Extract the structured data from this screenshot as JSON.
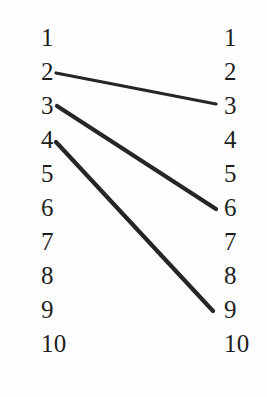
{
  "diagram": {
    "type": "bipartite-mapping",
    "background_color": "#fefefe",
    "text_color": "#1e1e1e",
    "edge_color": "#262626",
    "left_column": {
      "name": "left-column",
      "x": 41,
      "nodes": [
        {
          "label": "1",
          "y": 43
        },
        {
          "label": "2",
          "y": 77
        },
        {
          "label": "3",
          "y": 111
        },
        {
          "label": "4",
          "y": 145
        },
        {
          "label": "5",
          "y": 179
        },
        {
          "label": "6",
          "y": 213
        },
        {
          "label": "7",
          "y": 247
        },
        {
          "label": "8",
          "y": 281
        },
        {
          "label": "9",
          "y": 315
        },
        {
          "label": "10",
          "y": 349
        }
      ]
    },
    "right_column": {
      "name": "right-column",
      "x": 224,
      "nodes": [
        {
          "label": "1",
          "y": 43
        },
        {
          "label": "2",
          "y": 77
        },
        {
          "label": "3",
          "y": 111
        },
        {
          "label": "4",
          "y": 145
        },
        {
          "label": "5",
          "y": 179
        },
        {
          "label": "6",
          "y": 213
        },
        {
          "label": "7",
          "y": 247
        },
        {
          "label": "8",
          "y": 281
        },
        {
          "label": "9",
          "y": 315
        },
        {
          "label": "10",
          "y": 349
        }
      ]
    },
    "edges": [
      {
        "from": "2",
        "to": "3",
        "x1": 56,
        "y1": 73,
        "x2": 216,
        "y2": 104,
        "width": 3.2
      },
      {
        "from": "3",
        "to": "6",
        "x1": 57,
        "y1": 106,
        "x2": 216,
        "y2": 209,
        "width": 4.2
      },
      {
        "from": "4",
        "to": "9",
        "x1": 56,
        "y1": 142,
        "x2": 213,
        "y2": 311,
        "width": 4.2
      }
    ]
  }
}
